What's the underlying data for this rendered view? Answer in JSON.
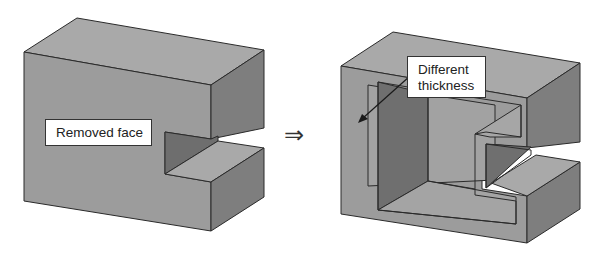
{
  "diagram": {
    "left_shape": {
      "label": "Removed face",
      "description": "Solid block with a rectangular slot cut into its right side"
    },
    "operator": {
      "symbol": "⇒",
      "meaning": "implies / results in"
    },
    "right_shape": {
      "label_line1": "Different",
      "label_line2": "thickness",
      "description": "Shelled version of the block with the front face removed, showing wall thickness",
      "arrow": "pointer from label to left wall"
    },
    "colors": {
      "top_face": "#a9a9a9",
      "front_face": "#9a9a9a",
      "side_face": "#7c7c7c",
      "inner_dark": "#6f6f6f",
      "inner_floor": "#a4a4a4",
      "edge": "#2a2a2a"
    }
  }
}
